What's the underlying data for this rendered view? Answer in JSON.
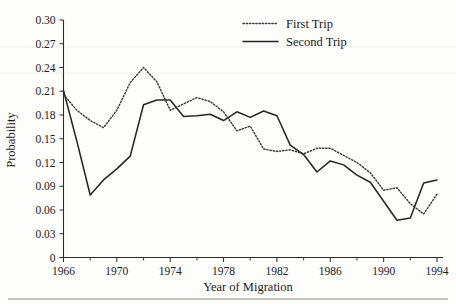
{
  "chart_data": {
    "type": "line",
    "title": "",
    "xlabel": "Year of Migration",
    "ylabel": "Probability",
    "xlim": [
      1966,
      1994
    ],
    "ylim": [
      0,
      0.3
    ],
    "grid": false,
    "legend_position": "top-center-right",
    "x_tick_labels": [
      "1966",
      "1970",
      "1974",
      "1978",
      "1982",
      "1986",
      "1990",
      "1994"
    ],
    "x_tick_values": [
      1966,
      1970,
      1974,
      1978,
      1982,
      1986,
      1990,
      1994
    ],
    "x_minor_tick_values": [
      1968,
      1972,
      1976,
      1980,
      1984,
      1988,
      1992
    ],
    "y_tick_labels": [
      "0",
      "0.03",
      "0.06",
      "0.09",
      "0.12",
      "0.15",
      "0.18",
      "0.21",
      "0.24",
      "0.27",
      "0.30"
    ],
    "y_tick_values": [
      0,
      0.03,
      0.06,
      0.09,
      0.12,
      0.15,
      0.18,
      0.21,
      0.24,
      0.27,
      0.3
    ],
    "x": [
      1966,
      1967,
      1968,
      1969,
      1970,
      1971,
      1972,
      1973,
      1974,
      1975,
      1976,
      1977,
      1978,
      1979,
      1980,
      1981,
      1982,
      1983,
      1984,
      1985,
      1986,
      1987,
      1988,
      1989,
      1990,
      1991,
      1992,
      1993,
      1994
    ],
    "series": [
      {
        "name": "First Trip",
        "style": "dotted",
        "color": "#3a3a38",
        "values": [
          0.206,
          0.186,
          0.173,
          0.164,
          0.186,
          0.221,
          0.24,
          0.222,
          0.186,
          0.194,
          0.202,
          0.197,
          0.184,
          0.16,
          0.166,
          0.137,
          0.134,
          0.136,
          0.131,
          0.138,
          0.138,
          0.129,
          0.12,
          0.107,
          0.085,
          0.088,
          0.068,
          0.055,
          0.08
        ]
      },
      {
        "name": "Second Trip",
        "style": "solid",
        "color": "#262625",
        "values": [
          0.211,
          0.147,
          0.079,
          0.098,
          0.112,
          0.128,
          0.193,
          0.199,
          0.199,
          0.178,
          0.179,
          0.181,
          0.173,
          0.184,
          0.177,
          0.185,
          0.179,
          0.142,
          0.13,
          0.108,
          0.122,
          0.117,
          0.104,
          0.095,
          0.071,
          0.047,
          0.05,
          0.094,
          0.098
        ]
      }
    ]
  },
  "legend": {
    "entries": [
      {
        "label": "First Trip",
        "style": "dotted"
      },
      {
        "label": "Second Trip",
        "style": "solid"
      }
    ]
  },
  "axes": {
    "y_axis_title": "Probability",
    "x_axis_title": "Year of Migration"
  }
}
